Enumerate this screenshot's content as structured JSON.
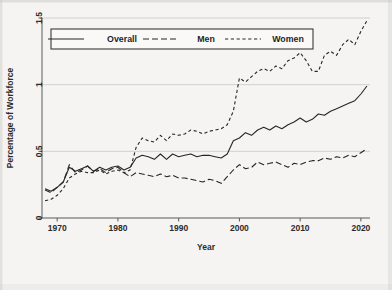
{
  "figure": {
    "background_color": "#f5f4f2",
    "plot_area": {
      "left": 42,
      "right": 370,
      "top": 18,
      "bottom": 218
    }
  },
  "chart_data": {
    "type": "line",
    "title": "",
    "subtitle": "",
    "xlabel": "Year",
    "ylabel": "Percentage of Workforce",
    "xlim": [
      1967.5,
      2021.5
    ],
    "ylim": [
      0,
      1.5
    ],
    "xticks": [
      1970,
      1980,
      1990,
      2000,
      2010,
      2020
    ],
    "xtick_labels": [
      "1970",
      "1980",
      "1990",
      "2000",
      "2010",
      "2020"
    ],
    "yticks": [
      0,
      0.5,
      1,
      1.5
    ],
    "ytick_labels": [
      "0",
      "0.5",
      "1",
      "1.5"
    ],
    "grid": "horizontal",
    "gridlines_y": [
      0.5,
      1,
      1.5
    ],
    "legend_position": "top-left-inside",
    "line_color": "#262626",
    "grid_color": "#c9c7c4",
    "axis_color": "#5b5b5b",
    "x": [
      1968,
      1969,
      1970,
      1971,
      1972,
      1973,
      1974,
      1975,
      1976,
      1977,
      1978,
      1979,
      1980,
      1981,
      1982,
      1983,
      1984,
      1985,
      1986,
      1987,
      1988,
      1989,
      1990,
      1991,
      1992,
      1993,
      1994,
      1995,
      1996,
      1997,
      1998,
      1999,
      2000,
      2001,
      2002,
      2003,
      2004,
      2005,
      2006,
      2007,
      2008,
      2009,
      2010,
      2011,
      2012,
      2013,
      2014,
      2015,
      2016,
      2017,
      2018,
      2019,
      2020,
      2021
    ],
    "series": [
      {
        "name": "Overall",
        "dash": "solid",
        "values": [
          0.22,
          0.2,
          0.23,
          0.27,
          0.38,
          0.35,
          0.37,
          0.39,
          0.35,
          0.38,
          0.36,
          0.38,
          0.39,
          0.36,
          0.38,
          0.45,
          0.47,
          0.46,
          0.44,
          0.48,
          0.44,
          0.48,
          0.46,
          0.47,
          0.48,
          0.46,
          0.47,
          0.47,
          0.46,
          0.45,
          0.48,
          0.58,
          0.6,
          0.64,
          0.62,
          0.66,
          0.68,
          0.66,
          0.69,
          0.67,
          0.7,
          0.72,
          0.75,
          0.72,
          0.74,
          0.78,
          0.77,
          0.8,
          0.82,
          0.84,
          0.86,
          0.88,
          0.93,
          0.99
        ]
      },
      {
        "name": "Men",
        "dash": "long-dash",
        "values": [
          0.21,
          0.19,
          0.23,
          0.27,
          0.4,
          0.34,
          0.36,
          0.39,
          0.35,
          0.37,
          0.34,
          0.37,
          0.38,
          0.34,
          0.31,
          0.34,
          0.33,
          0.32,
          0.31,
          0.33,
          0.31,
          0.32,
          0.3,
          0.3,
          0.29,
          0.28,
          0.27,
          0.29,
          0.28,
          0.26,
          0.31,
          0.36,
          0.4,
          0.37,
          0.38,
          0.42,
          0.4,
          0.41,
          0.42,
          0.4,
          0.38,
          0.41,
          0.4,
          0.42,
          0.43,
          0.43,
          0.45,
          0.44,
          0.46,
          0.45,
          0.47,
          0.46,
          0.49,
          0.52
        ]
      },
      {
        "name": "Women",
        "dash": "short-dash",
        "values": [
          0.13,
          0.14,
          0.17,
          0.22,
          0.3,
          0.33,
          0.35,
          0.34,
          0.34,
          0.36,
          0.33,
          0.35,
          0.36,
          0.34,
          0.36,
          0.53,
          0.6,
          0.58,
          0.57,
          0.62,
          0.58,
          0.63,
          0.62,
          0.63,
          0.66,
          0.65,
          0.63,
          0.65,
          0.66,
          0.67,
          0.7,
          0.8,
          1.05,
          1.02,
          1.06,
          1.1,
          1.12,
          1.1,
          1.14,
          1.12,
          1.18,
          1.2,
          1.24,
          1.18,
          1.1,
          1.1,
          1.22,
          1.25,
          1.22,
          1.3,
          1.34,
          1.3,
          1.4,
          1.48
        ]
      }
    ]
  },
  "legend": {
    "entries": [
      {
        "label": "Overall",
        "dash": "solid"
      },
      {
        "label": "Men",
        "dash": "long-dash"
      },
      {
        "label": "Women",
        "dash": "short-dash"
      }
    ]
  }
}
